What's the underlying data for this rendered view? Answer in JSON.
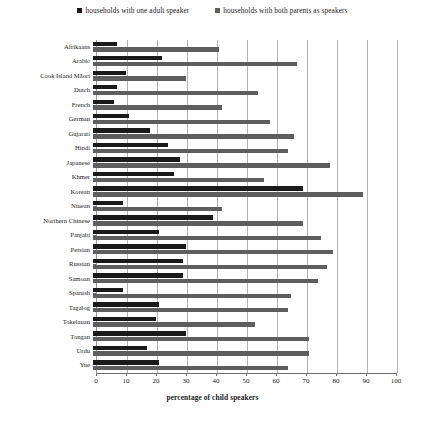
{
  "chart_data": {
    "type": "bar",
    "orientation": "horizontal",
    "title": "",
    "xlabel": "percentage of child speakers",
    "ylabel": "",
    "xlim": [
      0,
      100
    ],
    "xticks": [
      0,
      10,
      20,
      30,
      40,
      50,
      60,
      70,
      80,
      90,
      100
    ],
    "grid": true,
    "legend_position": "top",
    "categories": [
      "Afrikaans",
      "Arabic",
      "Cook Island Māori",
      "Dutch",
      "French",
      "German",
      "Gujarati",
      "Hindi",
      "Japanese",
      "Khmer",
      "Korean",
      "Niuean",
      "Northern Chinese",
      "Panjabi",
      "Persian",
      "Russian",
      "Samoan",
      "Spanish",
      "Tagalog",
      "Tokelauan",
      "Tongan",
      "Urdu",
      "Yue"
    ],
    "series": [
      {
        "name": "households with one adult speaker",
        "color": "#1a1a1a",
        "values": [
          8,
          23,
          11,
          8,
          7,
          12,
          19,
          25,
          29,
          27,
          70,
          10,
          40,
          22,
          31,
          30,
          30,
          10,
          22,
          21,
          31,
          18,
          22
        ]
      },
      {
        "name": "households with both parents as speakers",
        "color": "#5e5e5e",
        "values": [
          42,
          68,
          31,
          55,
          43,
          59,
          67,
          65,
          79,
          57,
          90,
          43,
          70,
          76,
          80,
          78,
          75,
          66,
          65,
          54,
          72,
          72,
          65
        ]
      }
    ]
  },
  "colors": {
    "series_one_adult": "#1a1a1a",
    "series_both_parents": "#5e5e5e",
    "gridline": "#b4b4b4",
    "axis": "#6e6e6e",
    "background": "#ffffff"
  }
}
